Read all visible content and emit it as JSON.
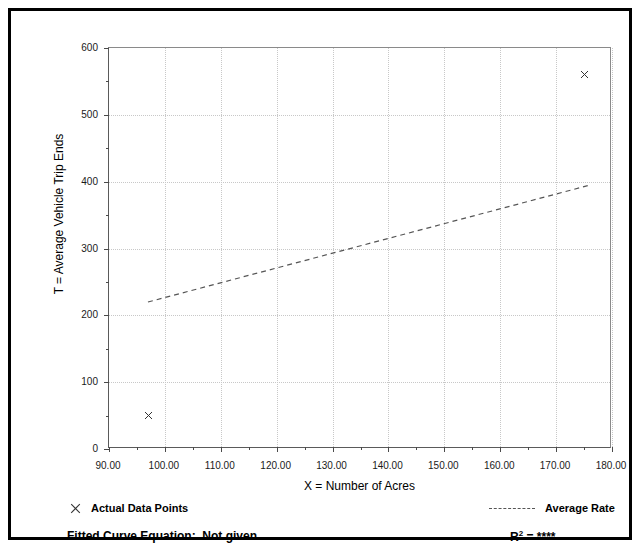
{
  "chart_data": {
    "type": "scatter",
    "title": "",
    "xlabel": "X = Number of Acres",
    "ylabel": "T = Average Vehicle Trip Ends",
    "xlim": [
      90,
      180
    ],
    "ylim": [
      0,
      600
    ],
    "xticks": [
      "90.00",
      "100.00",
      "110.00",
      "120.00",
      "130.00",
      "140.00",
      "150.00",
      "160.00",
      "170.00",
      "180.00"
    ],
    "xtick_values": [
      90,
      100,
      110,
      120,
      130,
      140,
      150,
      160,
      170,
      180
    ],
    "yticks": [
      "0",
      "100",
      "200",
      "300",
      "400",
      "500",
      "600"
    ],
    "ytick_values": [
      0,
      100,
      200,
      300,
      400,
      500,
      600
    ],
    "grid": true,
    "legend_position": "below-plot",
    "series": [
      {
        "name": "Actual Data Points",
        "type": "scatter",
        "marker": "x",
        "points": [
          {
            "x": 97,
            "y": 50
          },
          {
            "x": 175,
            "y": 560
          }
        ]
      },
      {
        "name": "Average Rate",
        "type": "line",
        "style": "dashed",
        "points": [
          {
            "x": 97,
            "y": 218
          },
          {
            "x": 176,
            "y": 393
          }
        ]
      }
    ],
    "annotations": {
      "fitted_curve_label": "Fitted Curve Equation:",
      "fitted_curve_value": "Not given",
      "r_squared_label": "R",
      "r_squared_exponent": "2",
      "r_squared_equals": "=",
      "r_squared_value": "****"
    },
    "colors": {
      "marker": "#333333",
      "trend_line": "#555555",
      "grid": "#c8c8c8",
      "axis": "#5a5a5a",
      "text": "#000000",
      "frame": "#000000",
      "background": "#ffffff"
    }
  },
  "legend": {
    "actual_label": "Actual Data Points",
    "average_label": "Average Rate"
  },
  "footer": {
    "fitted_equation_text": "Fitted Curve Equation:  Not given"
  }
}
